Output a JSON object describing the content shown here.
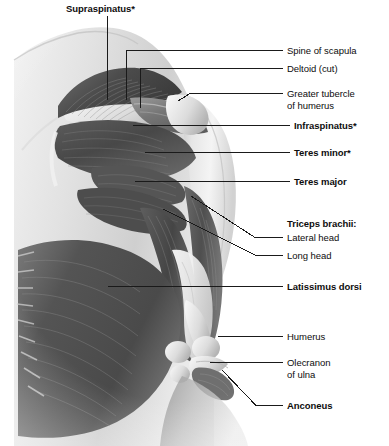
{
  "figure": {
    "width": 389,
    "height": 446,
    "background_color": "#ffffff",
    "line_color": "#1a1a1a",
    "text_color": "#0d0d0d"
  },
  "labels": [
    {
      "id": "supraspinatus",
      "text": "Supraspinatus*",
      "bold": true,
      "x": 66,
      "y": 3,
      "leader": {
        "type": "vertical",
        "x": 107,
        "y1": 16,
        "y2": 100
      }
    },
    {
      "id": "spine-of-scapula",
      "text": "Spine of scapula",
      "bold": false,
      "x": 287,
      "y": 45,
      "leader": {
        "type": "elbow",
        "x1": 126,
        "y1": 100,
        "x2": 126,
        "y2": 50,
        "x3": 283,
        "y3": 50
      }
    },
    {
      "id": "deltoid-cut",
      "text": "Deltoid (cut)",
      "bold": false,
      "x": 287,
      "y": 63,
      "leader": {
        "type": "elbow",
        "x1": 140,
        "y1": 108,
        "x2": 140,
        "y2": 68,
        "x3": 283,
        "y3": 68
      }
    },
    {
      "id": "greater-tubercle-of-humerus",
      "text": "Greater tubercle\nof humerus",
      "bold": false,
      "x": 287,
      "y": 88,
      "leader": {
        "type": "tick-horizontal",
        "tick_x1": 178,
        "tick_y1": 101,
        "tick_x2": 190,
        "tick_y2": 93,
        "x3": 283,
        "y3": 93
      }
    },
    {
      "id": "infraspinatus",
      "text": "Infraspinatus*",
      "bold": true,
      "x": 294,
      "y": 120,
      "leader": {
        "type": "horizontal",
        "x1": 133,
        "x2": 290,
        "y": 125
      }
    },
    {
      "id": "teres-minor",
      "text": "Teres minor*",
      "bold": true,
      "x": 294,
      "y": 147,
      "leader": {
        "type": "horizontal",
        "x1": 145,
        "x2": 290,
        "y": 152
      }
    },
    {
      "id": "teres-major",
      "text": "Teres major",
      "bold": true,
      "x": 294,
      "y": 176,
      "leader": {
        "type": "horizontal",
        "x1": 135,
        "x2": 290,
        "y": 181
      }
    },
    {
      "id": "triceps-brachii",
      "text": "Triceps brachii:",
      "bold": true,
      "x": 287,
      "y": 218,
      "leader": null
    },
    {
      "id": "lateral-head",
      "text": "Lateral head",
      "bold": false,
      "x": 287,
      "y": 232,
      "leader": {
        "type": "diagonal-elbow",
        "x1": 191,
        "y1": 196,
        "x2": 255,
        "y2": 237,
        "x3": 283,
        "y3": 237
      }
    },
    {
      "id": "long-head",
      "text": "Long head",
      "bold": false,
      "x": 287,
      "y": 250,
      "leader": {
        "type": "diagonal-elbow",
        "x1": 163,
        "y1": 209,
        "x2": 256,
        "y2": 255,
        "x3": 283,
        "y3": 255
      }
    },
    {
      "id": "latissimus-dorsi",
      "text": "Latissimus dorsi",
      "bold": true,
      "x": 287,
      "y": 281,
      "leader": {
        "type": "horizontal",
        "x1": 108,
        "x2": 283,
        "y": 286
      }
    },
    {
      "id": "humerus",
      "text": "Humerus",
      "bold": false,
      "x": 287,
      "y": 331,
      "leader": {
        "type": "horizontal",
        "x1": 218,
        "x2": 283,
        "y": 336
      }
    },
    {
      "id": "olecranon-of-ulna",
      "text": "Olecranon\nof ulna",
      "bold": false,
      "x": 287,
      "y": 357,
      "leader": {
        "type": "horizontal",
        "x1": 210,
        "x2": 283,
        "y": 362
      }
    },
    {
      "id": "anconeus",
      "text": "Anconeus",
      "bold": true,
      "x": 287,
      "y": 400,
      "leader": {
        "type": "diagonal-elbow",
        "x1": 222,
        "y1": 370,
        "x2": 256,
        "y2": 405,
        "x3": 283,
        "y3": 405
      }
    }
  ],
  "footnote": {
    "marker": "*",
    "meaning": "rotator cuff muscle"
  }
}
